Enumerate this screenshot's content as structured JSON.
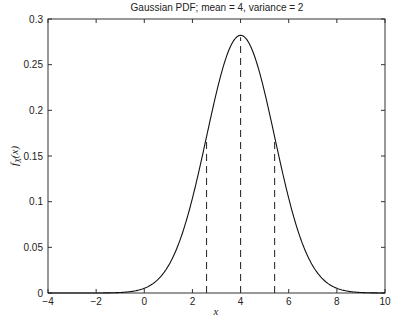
{
  "chart_data": {
    "type": "line",
    "title": "Gaussian PDF; mean = 4, variance = 2",
    "xlabel": "x",
    "ylabel": "f_X(x)",
    "xlim": [
      -4,
      10
    ],
    "ylim": [
      0,
      0.3
    ],
    "xticks": [
      -4,
      -2,
      0,
      2,
      4,
      6,
      8,
      10
    ],
    "yticks": [
      0,
      0.05,
      0.1,
      0.15,
      0.2,
      0.25,
      0.3
    ],
    "xtick_labels": [
      "−4",
      "−2",
      "0",
      "2",
      "4",
      "6",
      "8",
      "10"
    ],
    "ytick_labels": [
      "0",
      "0.05",
      "0.1",
      "0.15",
      "0.2",
      "0.25",
      "0.3"
    ],
    "grid": false,
    "series": [
      {
        "name": "Gaussian PDF",
        "mean": 4,
        "variance": 2,
        "style": "solid",
        "peak": 0.2821
      }
    ],
    "vertical_dashed_lines": [
      {
        "x": 2.586,
        "y_top": 0.1711,
        "label": "mean - sigma"
      },
      {
        "x": 4.0,
        "y_top": 0.2821,
        "label": "mean"
      },
      {
        "x": 5.414,
        "y_top": 0.1711,
        "label": "mean + sigma"
      }
    ]
  }
}
